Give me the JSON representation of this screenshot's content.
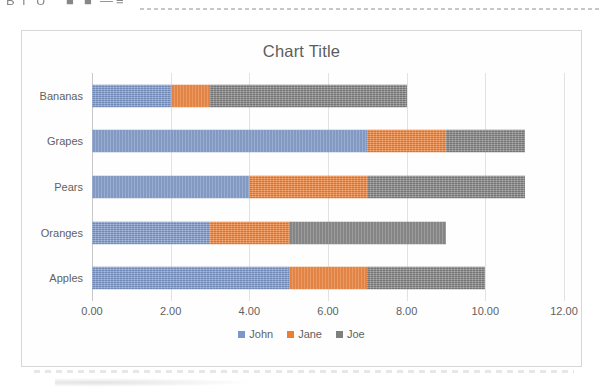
{
  "toolbar": {
    "icons": [
      {
        "name": "bold-icon",
        "glyph": "B",
        "x": 6
      },
      {
        "name": "italic-icon",
        "glyph": "I",
        "x": 22
      },
      {
        "name": "underline-icon",
        "glyph": "U",
        "x": 36
      },
      {
        "name": "paint-bucket-icon",
        "glyph": "■",
        "x": 66
      },
      {
        "name": "font-color-icon",
        "glyph": "■",
        "x": 84
      },
      {
        "name": "borders-icon",
        "glyph": "—",
        "x": 100
      },
      {
        "name": "align-icon",
        "glyph": "≡",
        "x": 116
      }
    ]
  },
  "chart": {
    "title": "Chart Title",
    "series_colors": {
      "john": "#7b96c8",
      "jane": "#ed7d31",
      "joe": "#7f7f7f"
    },
    "frame_border_color": "#d7d7d7",
    "gridline_color": "#e2e2e2",
    "text_color": "#616161"
  },
  "chart_data": {
    "type": "bar",
    "orientation": "horizontal",
    "stacked": true,
    "title": "Chart Title",
    "xlabel": "",
    "ylabel": "",
    "xlim": [
      0,
      12
    ],
    "xticks": [
      0,
      2,
      4,
      6,
      8,
      10,
      12
    ],
    "xtick_labels": [
      "0.00",
      "2.00",
      "4.00",
      "6.00",
      "8.00",
      "10.00",
      "12.00"
    ],
    "grid": true,
    "grid_axis": "x",
    "legend_position": "bottom",
    "categories": [
      "Bananas",
      "Grapes",
      "Pears",
      "Oranges",
      "Apples"
    ],
    "category_order_top_to_bottom": [
      "Bananas",
      "Grapes",
      "Pears",
      "Oranges",
      "Apples"
    ],
    "series": [
      {
        "name": "John",
        "color": "#7b96c8",
        "values": [
          2,
          7,
          4,
          3,
          5
        ]
      },
      {
        "name": "Jane",
        "color": "#ed7d31",
        "values": [
          1,
          2,
          3,
          2,
          2
        ]
      },
      {
        "name": "Joe",
        "color": "#7f7f7f",
        "values": [
          5,
          2,
          4,
          4,
          3
        ]
      }
    ],
    "stack_totals": [
      8,
      11,
      11,
      9,
      10
    ],
    "cumulative_edges": [
      {
        "category": "Bananas",
        "edges": [
          2,
          3,
          8
        ]
      },
      {
        "category": "Grapes",
        "edges": [
          7,
          9,
          11
        ]
      },
      {
        "category": "Pears",
        "edges": [
          4,
          7,
          11
        ]
      },
      {
        "category": "Oranges",
        "edges": [
          3,
          5,
          9
        ]
      },
      {
        "category": "Apples",
        "edges": [
          5,
          7,
          10
        ]
      }
    ],
    "legend": [
      "John",
      "Jane",
      "Joe"
    ]
  }
}
